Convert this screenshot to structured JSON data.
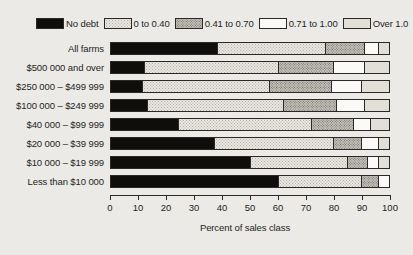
{
  "chart_data": {
    "type": "bar",
    "orientation": "horizontal",
    "stacked": true,
    "title": "",
    "xlabel": "Percent of sales class",
    "ylabel": "",
    "xlim": [
      0,
      100
    ],
    "xticks": [
      0,
      10,
      20,
      30,
      40,
      50,
      60,
      70,
      80,
      90,
      100
    ],
    "grid": false,
    "legend_position": "top",
    "categories": [
      "All farms",
      "$500 000 and over",
      "$250 000 – $499 999",
      "$100 000 – $249 999",
      "$40 000 – $99 999",
      "$20 000 – $39 999",
      "$10 000 – $19 999",
      "Less than $10 000"
    ],
    "series": [
      {
        "name": "No debt",
        "key": "nodebt",
        "fill": "solid-black",
        "color": "#100e0d",
        "values": [
          38,
          12,
          11,
          13,
          24,
          37,
          50,
          60
        ]
      },
      {
        "name": "0 to 0.40",
        "key": "r0_40",
        "fill": "light-dots",
        "color": "#e9e7e2",
        "values": [
          39,
          48,
          46,
          49,
          48,
          43,
          35,
          30
        ]
      },
      {
        "name": "0.41 to 0.70",
        "key": "r41_70",
        "fill": "gray-dots",
        "color": "#c2bfb8",
        "values": [
          14,
          20,
          22,
          19,
          15,
          10,
          7,
          6
        ]
      },
      {
        "name": "0.71 to 1.00",
        "key": "r71_100",
        "fill": "white",
        "color": "#fbfaf8",
        "values": [
          5,
          11,
          11,
          10,
          6,
          6,
          4,
          4
        ]
      },
      {
        "name": "Over 1.0",
        "key": "over1",
        "fill": "light-gray",
        "color": "#e2dfd9",
        "values": [
          4,
          9,
          10,
          9,
          7,
          4,
          4,
          0
        ]
      }
    ]
  },
  "legend": {
    "items": [
      {
        "label": "No debt"
      },
      {
        "label": "0 to 0.40"
      },
      {
        "label": "0.41 to 0.70"
      },
      {
        "label": "0.71 to 1.00"
      },
      {
        "label": "Over 1.0"
      }
    ]
  },
  "axis": {
    "x_title": "Percent of sales class"
  }
}
